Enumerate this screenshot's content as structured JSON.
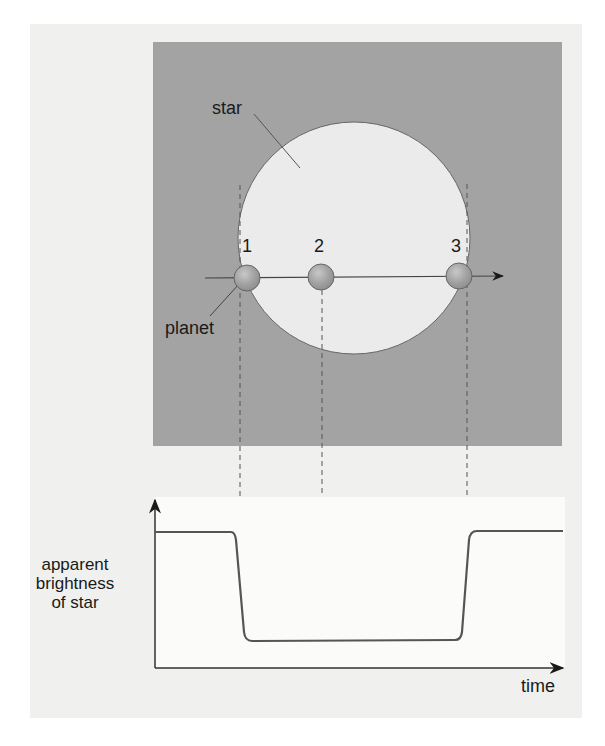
{
  "diagram": {
    "labels": {
      "star": "star",
      "planet": "planet",
      "positions": [
        "1",
        "2",
        "3"
      ]
    },
    "colors": {
      "panel": "#a3a3a3",
      "star_fill": "#ebebeb",
      "planet_fill": "#9e9e9e",
      "background": "#f0f0ef",
      "curve": "#555555"
    }
  },
  "chart_data": {
    "type": "line",
    "title": "",
    "xlabel": "time",
    "ylabel": "apparent brightness of star",
    "x": [
      0,
      0.2,
      0.22,
      0.26,
      0.28,
      0.66,
      0.68,
      0.72,
      0.74,
      1.0
    ],
    "series": [
      {
        "name": "apparent brightness",
        "values": [
          1.0,
          1.0,
          0.95,
          0.1,
          0.0,
          0.0,
          0.1,
          0.95,
          1.0,
          1.0
        ]
      }
    ],
    "annotations": [
      {
        "label": "1",
        "x": 0.21,
        "note": "planet begins transit (ingress)"
      },
      {
        "label": "2",
        "x": 0.4,
        "note": "planet fully in front of star"
      },
      {
        "label": "3",
        "x": 0.75,
        "note": "planet ends transit (egress)"
      }
    ],
    "grid": false,
    "legend": null,
    "axis_ticks": "none"
  }
}
